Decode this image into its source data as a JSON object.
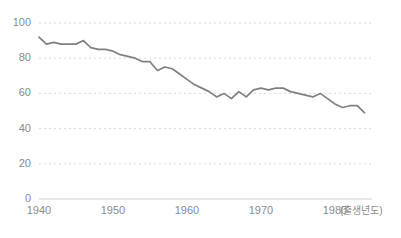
{
  "chart_data": {
    "type": "line",
    "title": "",
    "subtitle": "",
    "xlabel": "(출생년도)",
    "ylabel": "",
    "xlim": [
      1940,
      1985
    ],
    "ylim": [
      0,
      100
    ],
    "grid": true,
    "legend": null,
    "line_color": "#808080",
    "grid_color": "#d8d8d8",
    "axis_color": "#bdbdbd",
    "tick_text_color": "#8a8a8a",
    "y_ticks": [
      0,
      20,
      40,
      60,
      80,
      100
    ],
    "y_tick_labels": [
      "0",
      "20",
      "40",
      "60",
      "80",
      "100"
    ],
    "x_ticks": [
      1940,
      1950,
      1960,
      1970,
      1980
    ],
    "x_tick_labels": [
      "1940",
      "1950",
      "1960",
      "1970",
      "1980"
    ],
    "x": [
      1940,
      1941,
      1942,
      1943,
      1944,
      1945,
      1946,
      1947,
      1948,
      1949,
      1950,
      1951,
      1952,
      1953,
      1954,
      1955,
      1956,
      1957,
      1958,
      1959,
      1960,
      1961,
      1962,
      1963,
      1964,
      1965,
      1966,
      1967,
      1968,
      1969,
      1970,
      1971,
      1972,
      1973,
      1974,
      1975,
      1976,
      1977,
      1978,
      1979,
      1980,
      1981,
      1982,
      1983,
      1984
    ],
    "values": [
      92,
      88,
      89,
      88,
      88,
      88,
      90,
      86,
      85,
      85,
      84,
      82,
      81,
      80,
      78,
      78,
      73,
      75,
      74,
      71,
      68,
      65,
      63,
      61,
      58,
      60,
      57,
      61,
      58,
      62,
      63,
      62,
      63,
      63,
      61,
      60,
      59,
      58,
      60,
      57,
      54,
      52,
      53,
      53,
      49
    ],
    "series_name": ""
  }
}
